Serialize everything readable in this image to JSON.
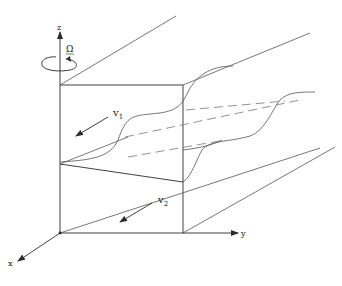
{
  "diagram": {
    "axes": {
      "x_label": "x",
      "y_label": "y",
      "z_label": "z"
    },
    "rotation": {
      "symbol": "Ω",
      "underline": true
    },
    "layers": [
      {
        "name": "upper layer",
        "velocity_label": "v",
        "subscript": "1"
      },
      {
        "name": "lower layer",
        "velocity_label": "v",
        "subscript": "2"
      }
    ],
    "colors": {
      "line": "#2a2a2a",
      "background": "#ffffff"
    }
  }
}
